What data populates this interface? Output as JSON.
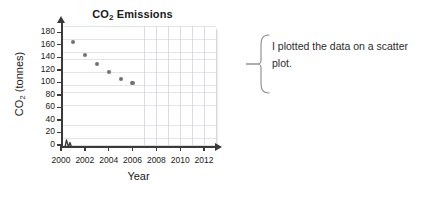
{
  "chart_data": {
    "type": "scatter",
    "title": "CO2 Emissions",
    "title_main": "CO",
    "title_sub": "2",
    "title_rest": " Emissions",
    "xlabel": "Year",
    "ylabel": "CO2 (tonnes)",
    "ylabel_main": "CO",
    "ylabel_sub": "2",
    "ylabel_rest": " (tonnes)",
    "x": [
      2001,
      2002,
      2003,
      2004,
      2005,
      2006
    ],
    "values": [
      164,
      144,
      129,
      116,
      105,
      99
    ],
    "points": [
      {
        "x": 2001,
        "y": 164
      },
      {
        "x": 2002,
        "y": 144
      },
      {
        "x": 2003,
        "y": 129
      },
      {
        "x": 2004,
        "y": 116
      },
      {
        "x": 2005,
        "y": 105
      },
      {
        "x": 2006,
        "y": 99
      }
    ],
    "xlim": [
      2000,
      2013
    ],
    "ylim": [
      0,
      190
    ],
    "xticks": [
      2000,
      2002,
      2004,
      2006,
      2008,
      2010,
      2012
    ],
    "yticks": [
      0,
      20,
      40,
      60,
      80,
      100,
      120,
      140,
      160,
      180
    ],
    "xtick_labels": [
      "2000",
      "2002",
      "2004",
      "2006",
      "2008",
      "2010",
      "2012"
    ],
    "ytick_labels": [
      "0",
      "20",
      "40",
      "60",
      "80",
      "100",
      "120",
      "140",
      "160",
      "180"
    ],
    "grid": true,
    "legend": null,
    "axis_break": true,
    "point_color": "#6e7276",
    "axis_color": "#3a3a3a",
    "grid_color": "#d9dde0"
  },
  "callout": {
    "text": "I plotted the data on a scatter plot.",
    "arrow_direction": "left"
  }
}
